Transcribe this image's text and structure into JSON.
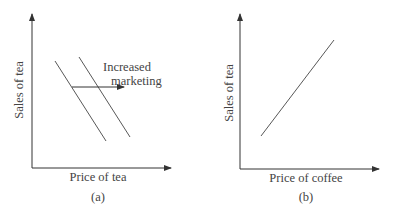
{
  "panels": [
    {
      "id": "a",
      "caption": "(a)",
      "xlabel": "Price of tea",
      "ylabel": "Sales of tea",
      "annotation": [
        "Increased",
        "marketing"
      ]
    },
    {
      "id": "b",
      "caption": "(b)",
      "xlabel": "Price of coffee",
      "ylabel": "Sales of tea"
    }
  ],
  "colors": {
    "line": "#444444",
    "text": "#444444"
  }
}
